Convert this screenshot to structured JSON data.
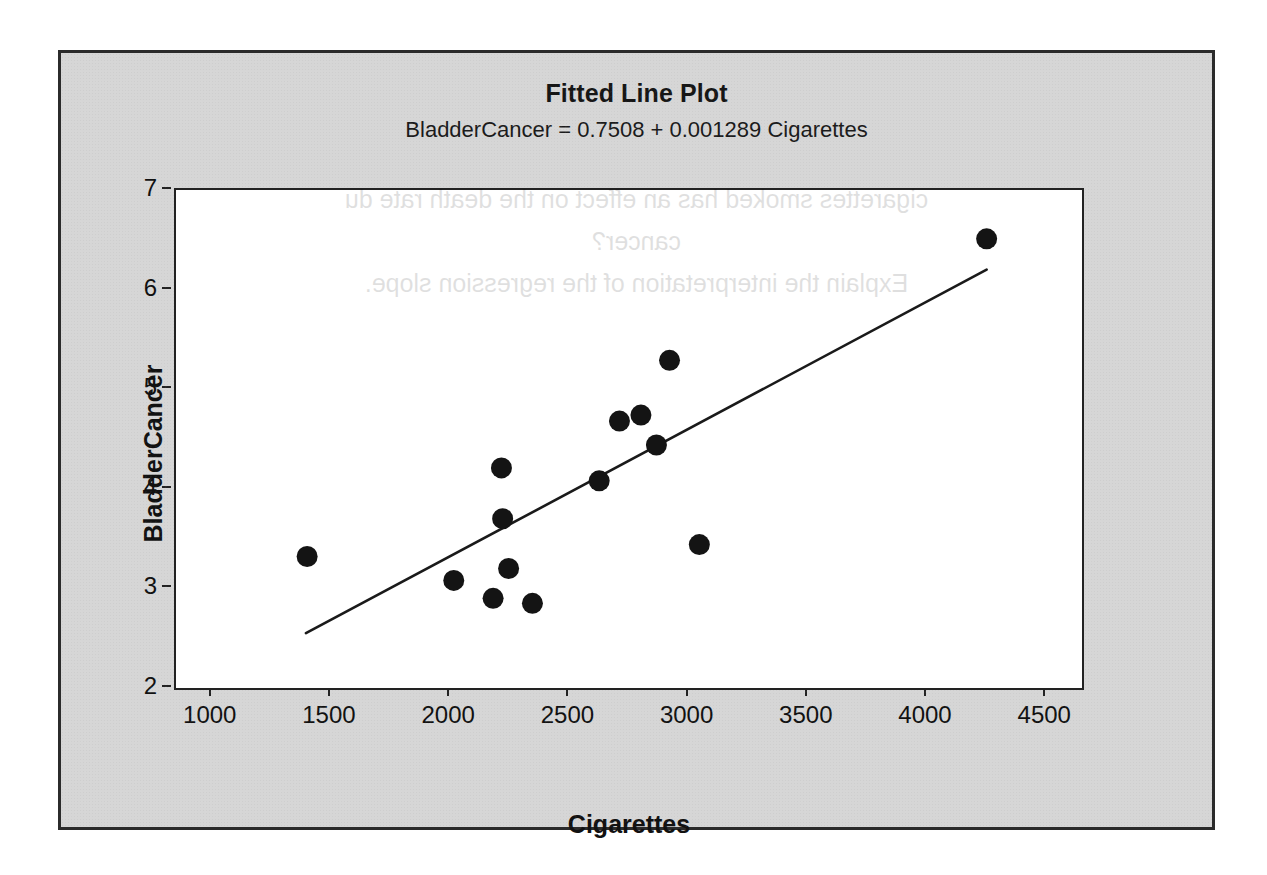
{
  "chart_data": {
    "type": "scatter",
    "title": "Fitted Line Plot",
    "subtitle": "BladderCancer =  0.7508 + 0.001289 Cigarettes",
    "xlabel": "Cigarettes",
    "ylabel": "BladderCancer",
    "xlim": [
      850,
      4650
    ],
    "ylim": [
      2,
      7
    ],
    "xticks": [
      1000,
      1500,
      2000,
      2500,
      3000,
      3500,
      4000,
      4500
    ],
    "yticks": [
      2,
      3,
      4,
      5,
      6,
      7
    ],
    "grid": false,
    "legend": "none",
    "regression": {
      "intercept": 0.7508,
      "slope": 0.001289,
      "x_start": 1395,
      "x_end": 4250,
      "y_start": 2.55,
      "y_end": 6.2
    },
    "points": [
      {
        "x": 1400,
        "y": 3.32
      },
      {
        "x": 2015,
        "y": 3.08
      },
      {
        "x": 2180,
        "y": 2.9
      },
      {
        "x": 2215,
        "y": 4.21
      },
      {
        "x": 2220,
        "y": 3.7
      },
      {
        "x": 2245,
        "y": 3.2
      },
      {
        "x": 2345,
        "y": 2.85
      },
      {
        "x": 2625,
        "y": 4.08
      },
      {
        "x": 2710,
        "y": 4.68
      },
      {
        "x": 2800,
        "y": 4.74
      },
      {
        "x": 2865,
        "y": 4.44
      },
      {
        "x": 2920,
        "y": 5.29
      },
      {
        "x": 3045,
        "y": 3.44
      },
      {
        "x": 4250,
        "y": 6.51
      }
    ]
  },
  "bleed_through": {
    "line1": "cigarettes smoked has an effect on the death rate du",
    "line2": "cancer?",
    "line3": "Explain the interpretation of the regression slope."
  }
}
